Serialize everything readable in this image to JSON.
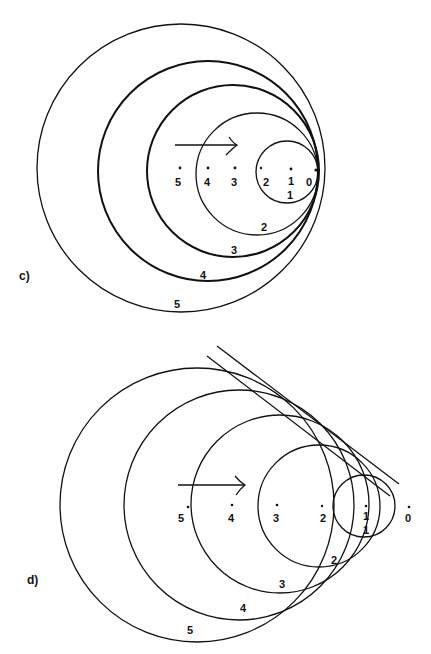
{
  "figure": {
    "panels": [
      {
        "id": "c",
        "label": "c)",
        "description": "Wavefronts from a source moving at the wave speed (Mach 1): all circles tangent at the current source position",
        "source_points": [
          "5",
          "4",
          "3",
          "2",
          "1",
          "0"
        ],
        "wavefront_labels": [
          "1",
          "2",
          "3",
          "4",
          "5"
        ],
        "motion_arrow": "right"
      },
      {
        "id": "d",
        "label": "d)",
        "description": "Wavefronts from a source moving faster than the wave speed: circles form a cone (Mach cone) bounded by tangent lines",
        "source_points": [
          "5",
          "4",
          "3",
          "2",
          "1",
          "0"
        ],
        "wavefront_labels": [
          "1",
          "2",
          "3",
          "4",
          "5"
        ],
        "motion_arrow": "right",
        "tangent_lines": 2
      }
    ]
  }
}
